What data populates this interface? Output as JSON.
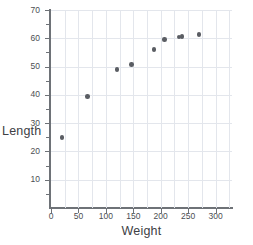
{
  "chart_data": {
    "type": "scatter",
    "title": "",
    "xlabel": "Weight",
    "ylabel": "Length",
    "xlim": [
      0,
      330
    ],
    "ylim": [
      0,
      70
    ],
    "xticks": [
      0,
      50,
      100,
      150,
      200,
      250,
      300
    ],
    "yticks": [
      10,
      20,
      30,
      40,
      50,
      60,
      70
    ],
    "y_minor_ticks": [
      5,
      15,
      25,
      35,
      45,
      55,
      65
    ],
    "grid": true,
    "grid_color": "#e3e6ec",
    "grid_x_step": 25,
    "grid_y_step": 10,
    "legend": "none",
    "marker_color": "#5a5d63",
    "axis_color": "#6e7277",
    "points": [
      {
        "x": 20,
        "y": 25.0
      },
      {
        "x": 67,
        "y": 39.5
      },
      {
        "x": 120,
        "y": 49.0
      },
      {
        "x": 147,
        "y": 50.8
      },
      {
        "x": 188,
        "y": 56.0
      },
      {
        "x": 207,
        "y": 59.5
      },
      {
        "x": 233,
        "y": 60.5
      },
      {
        "x": 239,
        "y": 60.6
      },
      {
        "x": 270,
        "y": 61.3
      }
    ]
  },
  "labels": {
    "x_axis_title": "Weight",
    "y_axis_title": "Length",
    "x_tick_labels": [
      "0",
      "50",
      "100",
      "150",
      "200",
      "250",
      "300"
    ],
    "y_tick_labels": [
      "10",
      "20",
      "30",
      "40",
      "50",
      "60",
      "70"
    ]
  },
  "footer": {
    "clipped_text": ""
  }
}
